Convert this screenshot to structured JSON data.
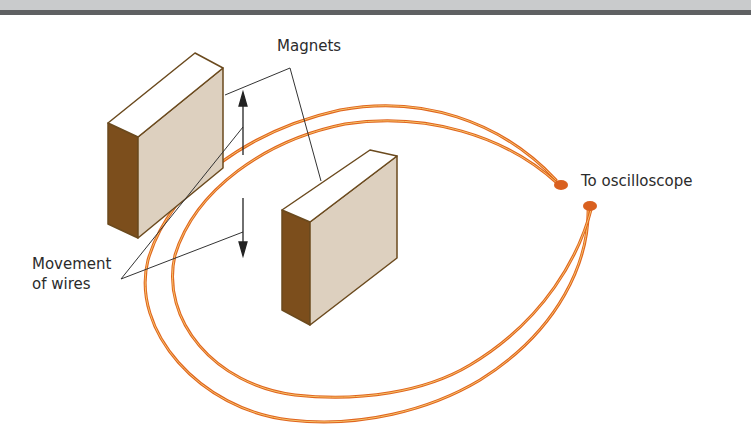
{
  "diagram": {
    "labels": {
      "magnets": "Magnets",
      "movement_line1": "Movement",
      "movement_line2": "of wires",
      "to_oscilloscope": "To oscilloscope"
    },
    "colors": {
      "header_light": "#c9cbcc",
      "header_dark": "#5f6163",
      "magnet_front": "#ddd0bf",
      "magnet_top": "#ffffff",
      "magnet_side": "#7c4e1c",
      "magnet_edge": "#6b4a1e",
      "wire": "#e0641e",
      "wire_highlight": "#f3b34a",
      "connector": "#d9601f",
      "leader_line": "#333333"
    }
  }
}
